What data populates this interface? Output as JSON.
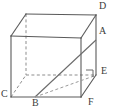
{
  "figure": {
    "type": "geometry-diagram",
    "shape_name": "rectangular-prism",
    "background_color": "#ffffff",
    "edge_color": "#5a5a5a",
    "hidden_edge_color": "#8d8d8d",
    "label_color": "#3c3c3c",
    "labels": [
      {
        "id": "A",
        "text": "A",
        "x": 99,
        "y": 31
      },
      {
        "id": "B",
        "text": "B",
        "x": 32,
        "y": 99
      },
      {
        "id": "C",
        "text": "C",
        "x": 1,
        "y": 90
      },
      {
        "id": "D",
        "text": "D",
        "x": 99,
        "y": 2
      },
      {
        "id": "E",
        "text": "E",
        "x": 101,
        "y": 68
      },
      {
        "id": "F",
        "text": "F",
        "x": 88,
        "y": 99
      }
    ],
    "vertices": {
      "front_top_left": {
        "x": 11,
        "y": 36
      },
      "front_top_right": {
        "x": 81,
        "y": 38
      },
      "front_bottom_left": {
        "x": 11,
        "y": 97
      },
      "front_bottom_right": {
        "x": 81,
        "y": 97
      },
      "back_top_left": {
        "x": 26,
        "y": 14
      },
      "back_top_right": {
        "x": 96,
        "y": 15
      },
      "back_bottom_left": {
        "x": 26,
        "y": 75
      },
      "back_bottom_right": {
        "x": 96,
        "y": 75
      }
    },
    "diagonals": [
      {
        "name": "B-to-A-diagonal",
        "from": "B",
        "to": "A",
        "style": "solid"
      },
      {
        "name": "B-to-E-diagonal",
        "from": "B",
        "to": "E",
        "style": "dashed"
      },
      {
        "name": "C-to-back-bottom-left-diagonal",
        "from": "C",
        "to": "back_bottom_left",
        "style": "dashed"
      }
    ],
    "right_angle_marker": {
      "name": "right-angle-at-E",
      "x": 88,
      "y": 68
    }
  }
}
